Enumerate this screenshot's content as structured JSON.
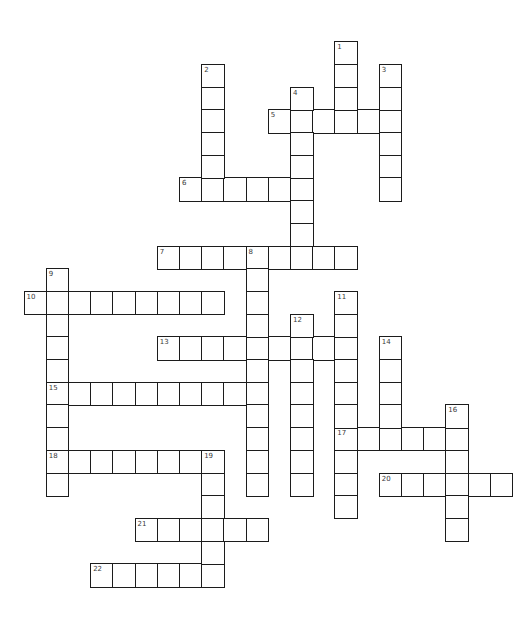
{
  "puzzle": {
    "type": "crossword",
    "grid_size": {
      "cols": 22,
      "rows": 24
    },
    "colors": {
      "border": "#1c1c1c",
      "cell_fill": "#ffffff",
      "number_text": "#3a3a3a",
      "background": "#ffffff"
    },
    "across": [
      {
        "number": "5",
        "col": 11,
        "row": 3,
        "length": 6
      },
      {
        "number": "6",
        "col": 7,
        "row": 6,
        "length": 6
      },
      {
        "number": "7",
        "col": 6,
        "row": 9,
        "length": 9
      },
      {
        "number": "10",
        "col": 0,
        "row": 11,
        "length": 9
      },
      {
        "number": "13",
        "col": 6,
        "row": 13,
        "length": 9
      },
      {
        "number": "15",
        "col": 1,
        "row": 15,
        "length": 10
      },
      {
        "number": "17",
        "col": 14,
        "row": 17,
        "length": 6
      },
      {
        "number": "18",
        "col": 1,
        "row": 18,
        "length": 8
      },
      {
        "number": "20",
        "col": 16,
        "row": 19,
        "length": 6
      },
      {
        "number": "21",
        "col": 5,
        "row": 21,
        "length": 6
      },
      {
        "number": "22",
        "col": 3,
        "row": 23,
        "length": 6
      }
    ],
    "down": [
      {
        "number": "1",
        "col": 14,
        "row": 0,
        "length": 4
      },
      {
        "number": "2",
        "col": 8,
        "row": 1,
        "length": 6
      },
      {
        "number": "3",
        "col": 16,
        "row": 1,
        "length": 6
      },
      {
        "number": "4",
        "col": 12,
        "row": 2,
        "length": 8
      },
      {
        "number": "8",
        "col": 10,
        "row": 9,
        "length": 11
      },
      {
        "number": "9",
        "col": 1,
        "row": 10,
        "length": 10
      },
      {
        "number": "11",
        "col": 14,
        "row": 11,
        "length": 10
      },
      {
        "number": "12",
        "col": 12,
        "row": 12,
        "length": 8
      },
      {
        "number": "14",
        "col": 16,
        "row": 13,
        "length": 5
      },
      {
        "number": "16",
        "col": 19,
        "row": 16,
        "length": 6
      },
      {
        "number": "19",
        "col": 8,
        "row": 18,
        "length": 6
      }
    ]
  }
}
